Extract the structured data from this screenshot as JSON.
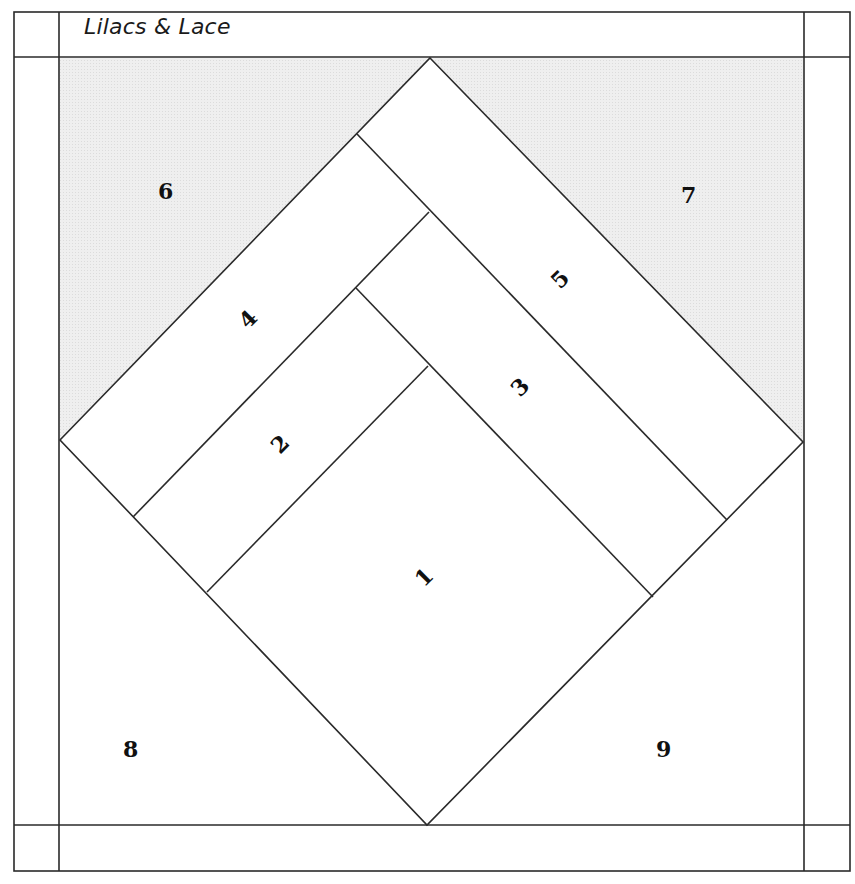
{
  "title": "Lilacs & Lace",
  "colors": {
    "line": "#2a2a2a",
    "shaded": "#ececec",
    "background": "#ffffff"
  },
  "pieces": [
    {
      "id": "1",
      "label": "1"
    },
    {
      "id": "2",
      "label": "2"
    },
    {
      "id": "3",
      "label": "3"
    },
    {
      "id": "4",
      "label": "4"
    },
    {
      "id": "5",
      "label": "5"
    },
    {
      "id": "6",
      "label": "6"
    },
    {
      "id": "7",
      "label": "7"
    },
    {
      "id": "8",
      "label": "8"
    },
    {
      "id": "9",
      "label": "9"
    }
  ]
}
